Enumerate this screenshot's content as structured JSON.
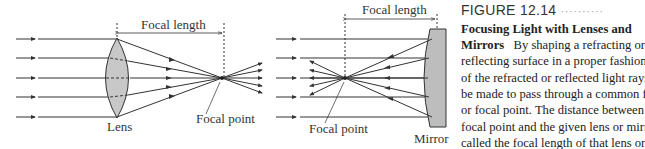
{
  "figure": {
    "left_diagram": {
      "focal_length_label": "Focal length",
      "element_label": "Lens",
      "focal_point_label": "Focal point"
    },
    "right_diagram": {
      "focal_length_label": "Focal length",
      "element_label": "Mirror",
      "focal_point_label": "Focal point"
    },
    "colors": {
      "lens_fill": "#c8c8c8",
      "mirror_fill": "#bdbdbd",
      "ray": "#333333"
    }
  },
  "caption": {
    "figure_number": "FIGURE 12.14",
    "dots": "··········",
    "title": "Focusing Light with Lenses and Mirrors",
    "lines": [
      {
        "bold": "Focusing Light with Lenses and",
        "text": ""
      },
      {
        "bold": "Mirrors",
        "text": "   By shaping a refracting or"
      },
      {
        "bold": "",
        "text": "reflecting surface in a proper fashion"
      },
      {
        "bold": "",
        "text": "of the refracted or reflected light rays"
      },
      {
        "bold": "",
        "text": "be made to pass through a common f"
      },
      {
        "bold": "",
        "text": "or focal point. The distance between"
      },
      {
        "bold": "",
        "text": "focal point and the given lens or mirr"
      },
      {
        "bold": "",
        "text": "called the focal length of that lens or"
      },
      {
        "bold": "",
        "text": "mirror."
      }
    ]
  }
}
